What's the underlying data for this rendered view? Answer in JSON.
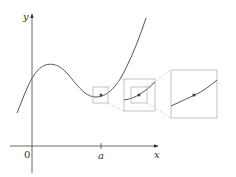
{
  "figure": {
    "axes": {
      "x_label": "x",
      "y_label": "y",
      "origin_label": "0",
      "tick_label": "a"
    },
    "colors": {
      "curve": "#555555",
      "axes": "#444444",
      "zoom_box": "#aaaaaa",
      "dashed_connector": "#c8c8c8",
      "point": "#444444"
    },
    "zoom_levels": [
      {
        "name": "original",
        "box": "small square around point (a, f(a))"
      },
      {
        "name": "zoom-1",
        "box": "magnified view with inner box"
      },
      {
        "name": "zoom-2",
        "box": "further magnified view, curve nearly straight"
      }
    ]
  }
}
